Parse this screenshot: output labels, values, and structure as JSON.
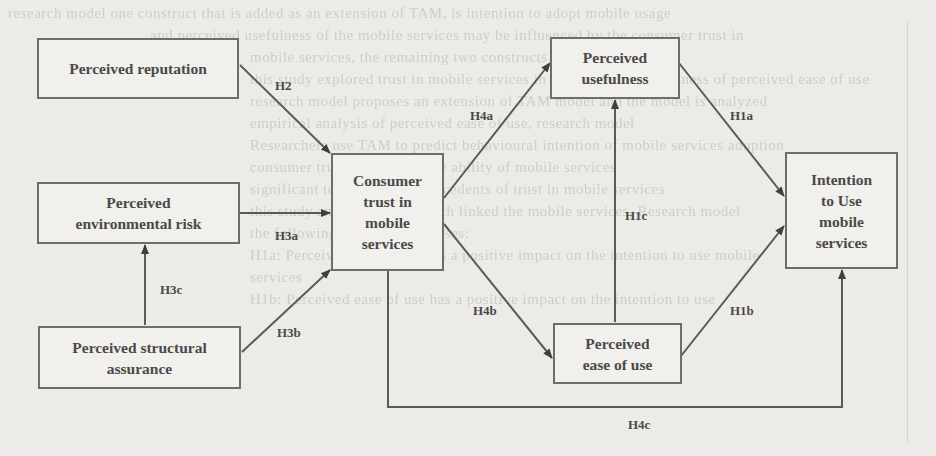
{
  "figure": {
    "type": "research-model-diagram",
    "nodes": [
      {
        "id": "reputation",
        "label": "Perceived reputation"
      },
      {
        "id": "env_risk",
        "label": "Perceived environmental risk"
      },
      {
        "id": "struct_assurance",
        "label": "Perceived structural assurance"
      },
      {
        "id": "trust",
        "label": "Consumer trust in mobile services"
      },
      {
        "id": "usefulness",
        "label": "Perceived usefulness"
      },
      {
        "id": "ease",
        "label": "Perceived ease of use"
      },
      {
        "id": "intention",
        "label": "Intention to Use mobile services"
      }
    ],
    "edges": [
      {
        "id": "H2",
        "from": "reputation",
        "to": "trust",
        "label": "H2"
      },
      {
        "id": "H3a",
        "from": "env_risk",
        "to": "trust",
        "label": "H3a"
      },
      {
        "id": "H3b",
        "from": "struct_assurance",
        "to": "trust",
        "label": "H3b"
      },
      {
        "id": "H3c",
        "from": "struct_assurance",
        "to": "env_risk",
        "label": "H3c"
      },
      {
        "id": "H4a",
        "from": "trust",
        "to": "usefulness",
        "label": "H4a"
      },
      {
        "id": "H4b",
        "from": "trust",
        "to": "ease",
        "label": "H4b"
      },
      {
        "id": "H4c",
        "from": "trust",
        "to": "intention",
        "label": "H4c"
      },
      {
        "id": "H1a",
        "from": "usefulness",
        "to": "intention",
        "label": "H1a"
      },
      {
        "id": "H1b",
        "from": "ease",
        "to": "intention",
        "label": "H1b"
      },
      {
        "id": "H1c",
        "from": "ease",
        "to": "usefulness",
        "label": "H1c"
      }
    ]
  },
  "background_text": [
    "research model one construct that is added as an extension of TAM, is intention to adopt mobile usage",
    "and perceived usefulness of the mobile services may be influenced by the consumer trust in",
    "mobile services, the remaining two constructs of mobile service.",
    "this study explored trust in mobile services in the perceived usefulness of perceived ease of use",
    "research model proposes an extension of TAM model and the model is analyzed",
    "empirical analysis of perceived ease of use, research model",
    "Researchers use TAM to predict behavioural intention of mobile services adoption",
    "consumer trust, PEOU, for the ability of mobile services",
    "significant to explain the antecedents of trust in mobile services",
    "this study and whether research linked the mobile services, Research model",
    "the following general hypotheses:",
    "H1a: Perceived usefulness has a positive impact on the intention to use mobile",
    "services",
    "H1b: Perceived ease of use has a positive impact on the intention to use"
  ]
}
